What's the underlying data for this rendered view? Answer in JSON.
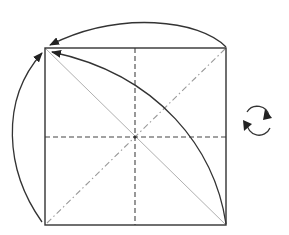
{
  "diagram": {
    "title": "",
    "colors": {
      "outline": "#333333",
      "dashed_crease": "#333333",
      "gray_line": "#aaaaaa",
      "dash_dot_line": "#999999",
      "arrow": "#222222",
      "background": "#ffffff"
    },
    "square": {
      "x1": 45,
      "y1": 48,
      "x2": 226,
      "y2": 225
    },
    "center": {
      "x": 135,
      "y": 137
    },
    "elements": [
      {
        "name": "square-outline",
        "style": "solid"
      },
      {
        "name": "vertical-valley-crease",
        "style": "dashed"
      },
      {
        "name": "horizontal-valley-crease",
        "style": "dashed"
      },
      {
        "name": "diagonal-gray-line",
        "style": "solid-light",
        "from": "top-left",
        "to": "bottom-right"
      },
      {
        "name": "diagonal-dash-dot-line",
        "style": "dash-dot",
        "from": "bottom-left",
        "to": "top-right"
      },
      {
        "name": "curved-fold-line",
        "style": "solid",
        "from": "bottom-right",
        "to": "top-left"
      },
      {
        "name": "arrow-top-right-to-top-left",
        "style": "arc-arrow"
      },
      {
        "name": "arrow-bottom-left-to-top-left",
        "style": "arc-arrow"
      },
      {
        "name": "rotate-symbol",
        "style": "circular-arrows"
      }
    ],
    "icons": {
      "rotate": "rotate-icon"
    }
  }
}
